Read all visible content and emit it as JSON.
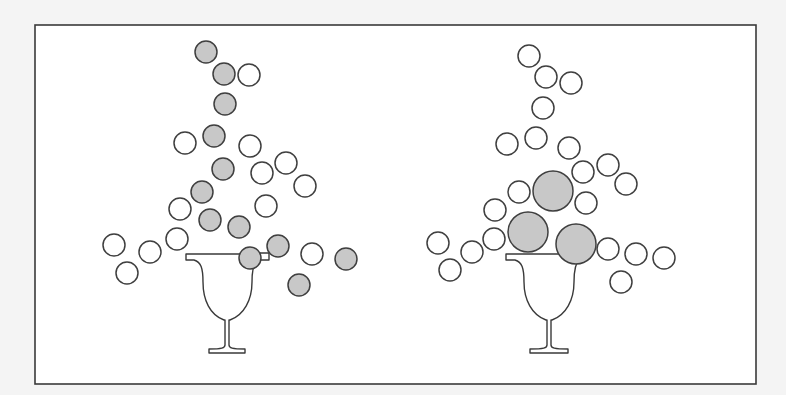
{
  "figure": {
    "background": "#f4f4f4",
    "frame": {
      "x": 35,
      "y": 25,
      "width": 721,
      "height": 359
    },
    "colors": {
      "filled": "#c8c8c8",
      "empty": "#ffffff",
      "stroke": "#3f3f3f"
    }
  },
  "panels": [
    {
      "name": "left-panel",
      "glass": {
        "cx": 227,
        "rim_y": 254,
        "rim_left": 186,
        "rim_right": 268,
        "base_y": 352
      },
      "straw_tab": {
        "x": 257,
        "y": 253,
        "width": 12,
        "height": 7
      },
      "balls": [
        {
          "cx": 206,
          "cy": 52,
          "r": 11,
          "filled": true
        },
        {
          "cx": 224,
          "cy": 74,
          "r": 11,
          "filled": true
        },
        {
          "cx": 249,
          "cy": 75,
          "r": 11,
          "filled": false
        },
        {
          "cx": 225,
          "cy": 104,
          "r": 11,
          "filled": true
        },
        {
          "cx": 185,
          "cy": 143,
          "r": 11,
          "filled": false
        },
        {
          "cx": 214,
          "cy": 136,
          "r": 11,
          "filled": true
        },
        {
          "cx": 250,
          "cy": 146,
          "r": 11,
          "filled": false
        },
        {
          "cx": 223,
          "cy": 169,
          "r": 11,
          "filled": true
        },
        {
          "cx": 262,
          "cy": 173,
          "r": 11,
          "filled": false
        },
        {
          "cx": 286,
          "cy": 163,
          "r": 11,
          "filled": false
        },
        {
          "cx": 305,
          "cy": 186,
          "r": 11,
          "filled": false
        },
        {
          "cx": 202,
          "cy": 192,
          "r": 11,
          "filled": true
        },
        {
          "cx": 180,
          "cy": 209,
          "r": 11,
          "filled": false
        },
        {
          "cx": 266,
          "cy": 206,
          "r": 11,
          "filled": false
        },
        {
          "cx": 210,
          "cy": 220,
          "r": 11,
          "filled": true
        },
        {
          "cx": 239,
          "cy": 227,
          "r": 11,
          "filled": true
        },
        {
          "cx": 177,
          "cy": 239,
          "r": 11,
          "filled": false
        },
        {
          "cx": 114,
          "cy": 245,
          "r": 11,
          "filled": false
        },
        {
          "cx": 150,
          "cy": 252,
          "r": 11,
          "filled": false
        },
        {
          "cx": 127,
          "cy": 273,
          "r": 11,
          "filled": false
        },
        {
          "cx": 250,
          "cy": 258,
          "r": 11,
          "filled": true
        },
        {
          "cx": 278,
          "cy": 246,
          "r": 11,
          "filled": true
        },
        {
          "cx": 312,
          "cy": 254,
          "r": 11,
          "filled": false
        },
        {
          "cx": 346,
          "cy": 259,
          "r": 11,
          "filled": true
        },
        {
          "cx": 299,
          "cy": 285,
          "r": 11,
          "filled": true
        }
      ]
    },
    {
      "name": "right-panel",
      "glass": {
        "cx": 548,
        "rim_y": 254,
        "rim_left": 506,
        "rim_right": 590,
        "base_y": 352
      },
      "balls": [
        {
          "cx": 529,
          "cy": 56,
          "r": 11,
          "filled": false
        },
        {
          "cx": 546,
          "cy": 77,
          "r": 11,
          "filled": false
        },
        {
          "cx": 571,
          "cy": 83,
          "r": 11,
          "filled": false
        },
        {
          "cx": 543,
          "cy": 108,
          "r": 11,
          "filled": false
        },
        {
          "cx": 507,
          "cy": 144,
          "r": 11,
          "filled": false
        },
        {
          "cx": 536,
          "cy": 138,
          "r": 11,
          "filled": false
        },
        {
          "cx": 569,
          "cy": 148,
          "r": 11,
          "filled": false
        },
        {
          "cx": 583,
          "cy": 172,
          "r": 11,
          "filled": false
        },
        {
          "cx": 608,
          "cy": 165,
          "r": 11,
          "filled": false
        },
        {
          "cx": 626,
          "cy": 184,
          "r": 11,
          "filled": false
        },
        {
          "cx": 553,
          "cy": 191,
          "r": 20,
          "filled": true
        },
        {
          "cx": 519,
          "cy": 192,
          "r": 11,
          "filled": false
        },
        {
          "cx": 586,
          "cy": 203,
          "r": 11,
          "filled": false
        },
        {
          "cx": 495,
          "cy": 210,
          "r": 11,
          "filled": false
        },
        {
          "cx": 528,
          "cy": 232,
          "r": 20,
          "filled": true
        },
        {
          "cx": 576,
          "cy": 244,
          "r": 20,
          "filled": true
        },
        {
          "cx": 494,
          "cy": 239,
          "r": 11,
          "filled": false
        },
        {
          "cx": 438,
          "cy": 243,
          "r": 11,
          "filled": false
        },
        {
          "cx": 472,
          "cy": 252,
          "r": 11,
          "filled": false
        },
        {
          "cx": 450,
          "cy": 270,
          "r": 11,
          "filled": false
        },
        {
          "cx": 608,
          "cy": 249,
          "r": 11,
          "filled": false
        },
        {
          "cx": 636,
          "cy": 254,
          "r": 11,
          "filled": false
        },
        {
          "cx": 664,
          "cy": 258,
          "r": 11,
          "filled": false
        },
        {
          "cx": 621,
          "cy": 282,
          "r": 11,
          "filled": false
        }
      ]
    }
  ]
}
